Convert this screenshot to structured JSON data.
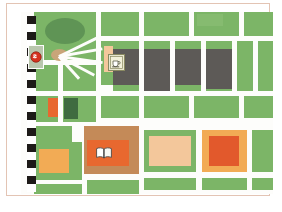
{
  "figure": {
    "type": "illustrated-city-map",
    "title": "City block map illustration",
    "frame_color": "#e3c4b4",
    "background": "#ffffff"
  },
  "palette": {
    "green": "#7cb567",
    "green_light": "#86bb70",
    "green_dark": "#3f6b40",
    "park_green": "#5f9455",
    "building_gray": "#5d5a57",
    "peach": "#f3c79b",
    "tan": "#c48a58",
    "orange_light": "#f2ab55",
    "orange_dark": "#e2592c",
    "road_white": "#fdfdfb",
    "checker_black": "#1d1a18",
    "roundabout_hub": "#c9a579"
  },
  "legend": {
    "checker_strip_label": "checkered boundary strip",
    "road_label": "road",
    "block_label": "city block"
  },
  "pois": [
    {
      "id": "stop-marker",
      "icon": "stop-sign-icon",
      "label": "Stop",
      "color": "#d6331f",
      "x": 7,
      "y": 33
    },
    {
      "id": "cafe-marker",
      "icon": "coffee-cup-icon",
      "label": "Cafe",
      "color": "#8a8a62",
      "x": 87,
      "y": 42
    },
    {
      "id": "library-marker",
      "icon": "open-book-icon",
      "label": "Library",
      "color": "#ffffff",
      "x": 73,
      "y": 133
    }
  ],
  "map_features": {
    "park_ellipse": "central park lawn",
    "roundabout": "roundabout with radiating avenues",
    "gray_buildings_count": 4,
    "orange_plaza": "orange plaza block",
    "peach_plaza": "peach plaza block"
  }
}
